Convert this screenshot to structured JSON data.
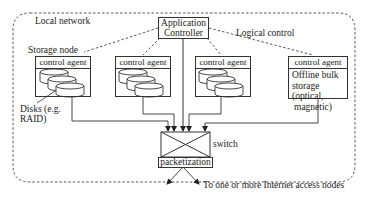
{
  "diagram": {
    "local_network_label": "Local network",
    "logical_control_label": "Logical control",
    "controller": {
      "line1": "Application",
      "line2": "Controller"
    },
    "storage_node_label": "Storage node",
    "nodes": [
      {
        "header": "control agent",
        "type": "disks"
      },
      {
        "header": "control agent",
        "type": "disks"
      },
      {
        "header": "control agent",
        "type": "disks"
      },
      {
        "header": "control agent",
        "type": "offline",
        "text": [
          "Offline bulk",
          "storage",
          "(optical,",
          "magnetic)"
        ]
      }
    ],
    "disks_label": {
      "line1": "Disks (e.g.",
      "line2": "RAID)"
    },
    "switch_label": "switch",
    "packetization_label": "packetization",
    "output_label": "To one or more Internet access nodes",
    "colors": {
      "line": "#333333",
      "background": "#ffffff"
    }
  }
}
